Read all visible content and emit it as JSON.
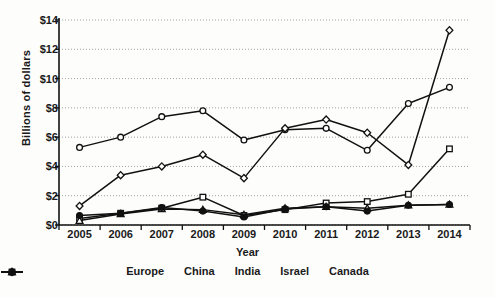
{
  "chart_data": {
    "type": "line",
    "title": "",
    "xlabel": "Year",
    "ylabel": "Billions of dollars",
    "categories": [
      "2005",
      "2006",
      "2007",
      "2008",
      "2009",
      "2010",
      "2011",
      "2012",
      "2013",
      "2014"
    ],
    "x": [
      2005,
      2006,
      2007,
      2008,
      2009,
      2010,
      2011,
      2012,
      2013,
      2014
    ],
    "ylim": [
      0,
      14
    ],
    "yticks": [
      0,
      2,
      4,
      6,
      8,
      10,
      12,
      14
    ],
    "ytick_labels": [
      "$0",
      "$2",
      "$4",
      "$6",
      "$8",
      "$10",
      "$12",
      "$14"
    ],
    "grid": true,
    "grid_axis": "y",
    "legend_position": "bottom",
    "series": [
      {
        "name": "Europe",
        "marker": "circle-open",
        "values": [
          5.3,
          6.0,
          7.4,
          7.8,
          5.8,
          6.5,
          6.6,
          5.1,
          8.3,
          9.4
        ]
      },
      {
        "name": "China",
        "marker": "diamond-open",
        "values": [
          1.3,
          3.4,
          4.0,
          4.8,
          3.2,
          6.6,
          7.2,
          6.3,
          4.1,
          13.3
        ]
      },
      {
        "name": "India",
        "marker": "square-open",
        "values": [
          0.45,
          0.8,
          1.15,
          1.9,
          0.65,
          1.05,
          1.5,
          1.6,
          2.1,
          5.2
        ]
      },
      {
        "name": "Israel",
        "marker": "triangle-open",
        "values": [
          0.3,
          0.75,
          1.1,
          1.05,
          0.7,
          1.15,
          1.25,
          1.15,
          1.35,
          1.4
        ]
      },
      {
        "name": "Canada",
        "marker": "circle-filled",
        "values": [
          0.65,
          0.8,
          1.2,
          0.95,
          0.55,
          1.1,
          1.25,
          0.95,
          1.35,
          1.4
        ]
      }
    ]
  },
  "legend": {
    "items": [
      {
        "label": "Europe",
        "marker": "circle-open"
      },
      {
        "label": "China",
        "marker": "diamond-open"
      },
      {
        "label": "India",
        "marker": "square-open"
      },
      {
        "label": "Israel",
        "marker": "triangle-open"
      },
      {
        "label": "Canada",
        "marker": "circle-filled"
      }
    ]
  },
  "colors": {
    "line": "#111111",
    "grid": "#999999",
    "axis": "#111111",
    "text": "#1a1a1a",
    "background": "#fdfdfc"
  }
}
